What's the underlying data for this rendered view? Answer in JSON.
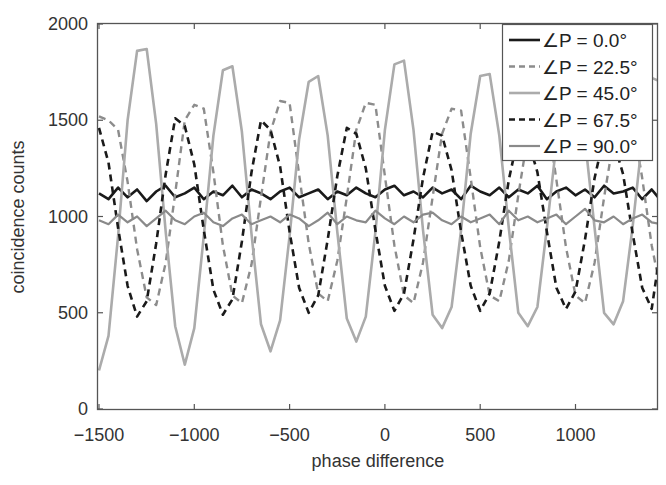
{
  "chart_data": {
    "type": "line",
    "title": "",
    "xlabel": "phase difference",
    "ylabel": "coincidence counts",
    "xlim": [
      -1500,
      1450
    ],
    "ylim": [
      0,
      2000
    ],
    "x_ticks": [
      -1500,
      -1000,
      -500,
      0,
      500,
      1000
    ],
    "x_tick_labels": [
      "−1500",
      "−1000",
      "−500",
      "0",
      "500",
      "1000"
    ],
    "y_ticks": [
      0,
      500,
      1000,
      1500,
      2000
    ],
    "y_tick_labels": [
      "0",
      "500",
      "1000",
      "1500",
      "2000"
    ],
    "grid": false,
    "legend_position": "upper right",
    "x": [
      -1500,
      -1450,
      -1400,
      -1350,
      -1300,
      -1250,
      -1200,
      -1150,
      -1100,
      -1050,
      -1000,
      -950,
      -900,
      -850,
      -800,
      -750,
      -700,
      -650,
      -600,
      -550,
      -500,
      -450,
      -400,
      -350,
      -300,
      -250,
      -200,
      -150,
      -100,
      -50,
      0,
      50,
      100,
      150,
      200,
      250,
      300,
      350,
      400,
      450,
      500,
      550,
      600,
      650,
      700,
      750,
      800,
      850,
      900,
      950,
      1000,
      1050,
      1100,
      1150,
      1200,
      1250,
      1300,
      1350,
      1400,
      1450
    ],
    "series": [
      {
        "name": "∠P = 0.0°",
        "color": "#1a1a1a",
        "dash": "solid",
        "width": 2.6,
        "values": [
          1120,
          1090,
          1150,
          1100,
          1140,
          1080,
          1130,
          1160,
          1100,
          1120,
          1150,
          1090,
          1130,
          1110,
          1160,
          1100,
          1140,
          1120,
          1090,
          1130,
          1150,
          1100,
          1120,
          1140,
          1090,
          1130,
          1110,
          1150,
          1120,
          1100,
          1140,
          1160,
          1110,
          1130,
          1100,
          1150,
          1120,
          1140,
          1090,
          1160,
          1130,
          1110,
          1150,
          1100,
          1140,
          1120,
          1160,
          1090,
          1130,
          1150,
          1110,
          1140,
          1100,
          1160,
          1120,
          1130,
          1150,
          1090,
          1140,
          1080
        ]
      },
      {
        "name": "∠P = 22.5°",
        "color": "#8c8c8c",
        "dash": "dashed",
        "width": 2.4,
        "values": [
          1520,
          1500,
          1450,
          1180,
          830,
          580,
          540,
          760,
          1120,
          1500,
          1580,
          1560,
          1230,
          850,
          590,
          550,
          750,
          1100,
          1440,
          1600,
          1590,
          1220,
          860,
          600,
          560,
          770,
          1100,
          1450,
          1590,
          1580,
          1210,
          850,
          590,
          550,
          760,
          1100,
          1430,
          1560,
          1550,
          1200,
          840,
          590,
          560,
          770,
          1110,
          1420,
          1540,
          1530,
          1190,
          840,
          590,
          550,
          760,
          1100,
          1400,
          1520,
          1500,
          1200,
          850,
          600
        ]
      },
      {
        "name": "∠P = 45.0°",
        "color": "#ababab",
        "dash": "solid",
        "width": 2.6,
        "values": [
          200,
          380,
          900,
          1500,
          1860,
          1870,
          1480,
          920,
          430,
          230,
          420,
          900,
          1420,
          1760,
          1780,
          1440,
          910,
          440,
          300,
          460,
          900,
          1400,
          1700,
          1730,
          1420,
          920,
          470,
          350,
          480,
          920,
          1450,
          1790,
          1810,
          1450,
          930,
          490,
          420,
          530,
          930,
          1430,
          1730,
          1740,
          1420,
          940,
          500,
          430,
          530,
          940,
          1380,
          1650,
          1690,
          1400,
          940,
          500,
          440,
          560,
          950,
          1400,
          1720,
          1700
        ]
      },
      {
        "name": "∠P = 67.5°",
        "color": "#1a1a1a",
        "dash": "dashed",
        "width": 2.6,
        "values": [
          1460,
          1280,
          940,
          640,
          480,
          560,
          860,
          1220,
          1510,
          1470,
          1270,
          930,
          620,
          490,
          570,
          870,
          1230,
          1500,
          1450,
          1260,
          920,
          630,
          500,
          590,
          880,
          1210,
          1460,
          1430,
          1250,
          930,
          640,
          510,
          600,
          880,
          1200,
          1440,
          1420,
          1240,
          920,
          640,
          510,
          600,
          870,
          1190,
          1420,
          1400,
          1230,
          920,
          630,
          520,
          610,
          880,
          1200,
          1420,
          1390,
          1220,
          910,
          630,
          520,
          860
        ]
      },
      {
        "name": "∠P = 90.0°",
        "color": "#8a8a8a",
        "dash": "solid",
        "width": 2.2,
        "values": [
          980,
          960,
          1010,
          970,
          1000,
          950,
          990,
          1030,
          980,
          960,
          1000,
          1020,
          970,
          950,
          990,
          1010,
          960,
          980,
          1000,
          970,
          1010,
          990,
          950,
          980,
          1020,
          960,
          1000,
          980,
          970,
          1030,
          990,
          960,
          1000,
          970,
          1010,
          1020,
          980,
          960,
          1000,
          970,
          990,
          1010,
          960,
          1030,
          980,
          1000,
          970,
          990,
          1010,
          960,
          1000,
          1040,
          980,
          970,
          1000,
          960,
          990,
          1010,
          970,
          960
        ]
      }
    ]
  },
  "figure": {
    "xlabel": "phase difference",
    "ylabel": "coincidence counts"
  }
}
